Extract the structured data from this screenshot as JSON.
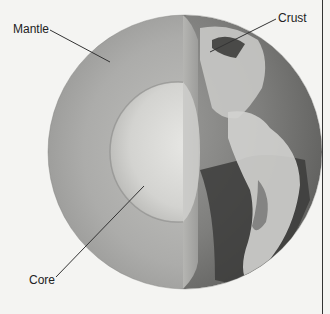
{
  "figure": {
    "type": "cutaway-diagram",
    "labels": {
      "mantle": "Mantle",
      "crust": "Crust",
      "core": "Core"
    },
    "colors": {
      "background": "#f4f4f2",
      "mantle": "#a9a9a7",
      "core": "#d9d9d6",
      "crust_surface": "#8c8c8a",
      "ocean": "#3a3a3a",
      "leader_line": "#333333"
    }
  }
}
